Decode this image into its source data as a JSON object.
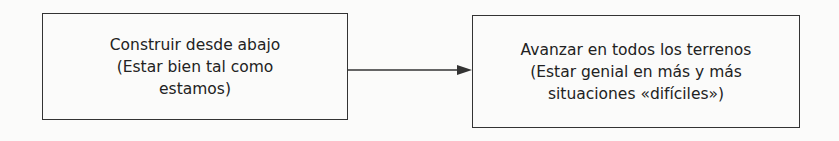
{
  "diagram": {
    "nodes": [
      {
        "id": "box1",
        "lines": [
          "Construir desde abajo",
          "(Estar bien tal como",
          "estamos)"
        ]
      },
      {
        "id": "box2",
        "lines": [
          "Avanzar en todos los terrenos",
          "(Estar genial en más y más",
          "situaciones «difíciles»)"
        ]
      }
    ],
    "edges": [
      {
        "from": "box1",
        "to": "box2",
        "type": "arrow"
      }
    ],
    "colors": {
      "stroke": "#333333",
      "background": "#fbfbfa",
      "text": "#222222"
    }
  }
}
